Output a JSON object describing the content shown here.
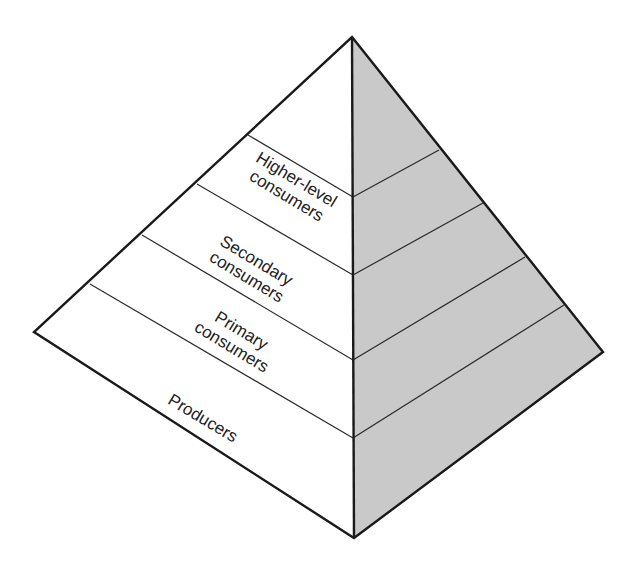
{
  "diagram": {
    "type": "ecological-pyramid",
    "colors": {
      "left_face": "#ffffff",
      "right_face": "#c9c9c9",
      "stroke": "#1a1a1a"
    },
    "levels": [
      {
        "id": "higher-level-consumers",
        "lines": [
          "Higher-level",
          "consumers"
        ]
      },
      {
        "id": "secondary-consumers",
        "lines": [
          "Secondary",
          "consumers"
        ]
      },
      {
        "id": "primary-consumers",
        "lines": [
          "Primary",
          "consumers"
        ]
      },
      {
        "id": "producers",
        "lines": [
          "Producers"
        ]
      }
    ]
  }
}
